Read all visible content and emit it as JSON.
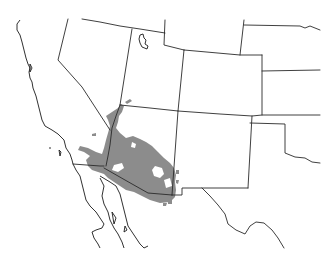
{
  "map": {
    "type": "species-range-map",
    "region": "Southwestern United States and northwestern Mexico",
    "colors": {
      "background": "#ffffff",
      "borders": "#2a2a2a",
      "range_fill": "#8c8c8c"
    },
    "features": [
      {
        "name": "state-borders",
        "label": ""
      },
      {
        "name": "coastline",
        "label": ""
      },
      {
        "name": "great-salt-lake",
        "label": ""
      },
      {
        "name": "distribution-range",
        "label": ""
      }
    ]
  }
}
